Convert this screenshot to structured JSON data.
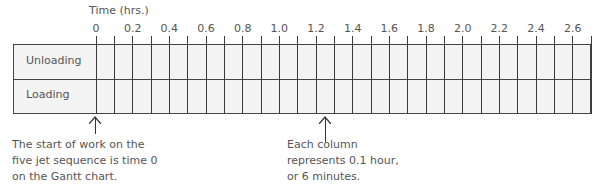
{
  "chart_data": {
    "type": "table",
    "axis_title": "Time (hrs.)",
    "tick_labels": [
      "0",
      "0.2",
      "0.4",
      "0.6",
      "0.8",
      "1.0",
      "1.2",
      "1.4",
      "1.6",
      "1.8",
      "2.0",
      "2.2",
      "2.4",
      "2.6"
    ],
    "column_width_hours": 0.1,
    "num_columns": 27,
    "xlim": [
      0,
      2.7
    ],
    "rows": [
      "Unloading",
      "Loading"
    ],
    "annotations": [
      {
        "text": "The start of work on the\nfive jet sequence is time 0\non the Gantt chart.",
        "points_to": 0
      },
      {
        "text": "Each column\nrepresents 0.1 hour,\nor 6 minutes.",
        "points_to": 1.25
      }
    ]
  },
  "chart": {
    "axis_title": "Time (hrs.)",
    "rows": {
      "unloading": "Unloading",
      "loading": "Loading"
    }
  },
  "notes": {
    "start": "The start of work on the\nfive jet sequence is time 0\non the Gantt chart.",
    "column": "Each column\nrepresents 0.1 hour,\nor 6 minutes."
  },
  "colors": {
    "grid": "#3a3a3a",
    "fill": "#f4f4f4",
    "text": "#555555"
  }
}
